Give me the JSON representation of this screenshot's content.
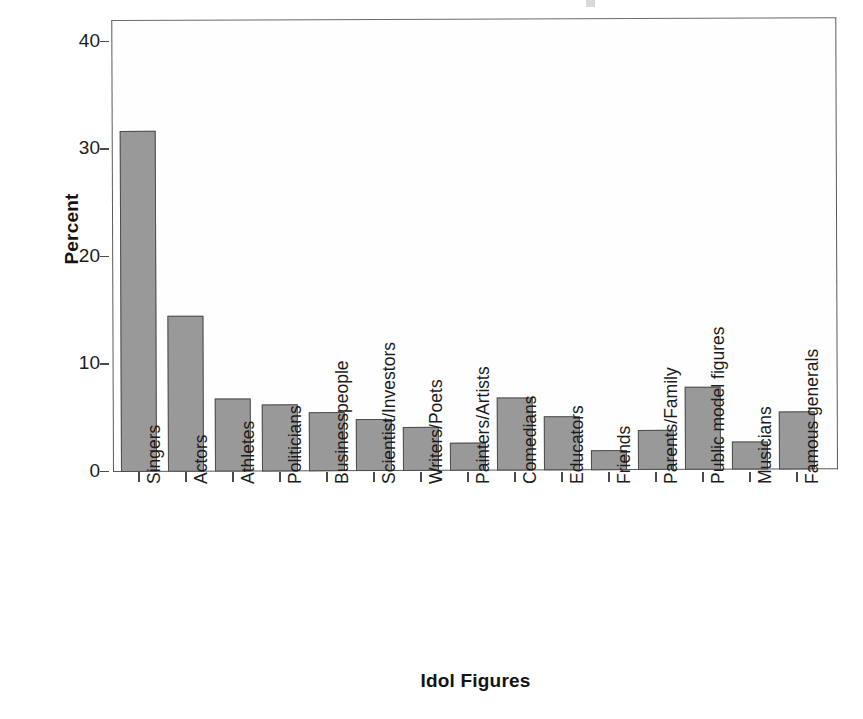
{
  "chart_data": {
    "type": "bar",
    "title": "",
    "xlabel": "Idol Figures",
    "ylabel": "Percent",
    "ylim": [
      0,
      42
    ],
    "yticks": [
      0,
      10,
      20,
      30,
      40
    ],
    "ytick_labels": [
      "0",
      "10",
      "20",
      "30",
      "40"
    ],
    "grid": false,
    "legend": null,
    "bar_color": "#999999",
    "bar_edge_color": "#4d4d4d",
    "axis_color": "#5a5a5a",
    "categories": [
      "Singers",
      "Actors",
      "Athletes",
      "Politicians",
      "Businesspeople",
      "Scientist/Investors",
      "Writers/Poets",
      "Painters/Artists",
      "Comedians",
      "Educators",
      "Friends",
      "Parents/Family",
      "Public model figures",
      "Musicians",
      "Famous generals"
    ],
    "values": [
      31.7,
      14.5,
      6.8,
      6.2,
      5.5,
      4.8,
      4.1,
      2.6,
      6.8,
      5.0,
      1.9,
      3.7,
      7.7,
      2.6,
      5.4
    ]
  }
}
